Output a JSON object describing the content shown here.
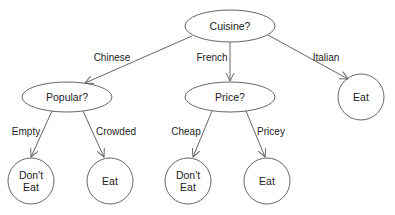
{
  "diagram": {
    "type": "decision-tree",
    "colors": {
      "stroke": "#666666",
      "text": "#222222",
      "background": "#ffffff"
    },
    "nodes": [
      {
        "id": "cuisine",
        "label": "Cuisine?",
        "shape": "ellipse"
      },
      {
        "id": "popular",
        "label": "Popular?",
        "shape": "ellipse"
      },
      {
        "id": "price",
        "label": "Price?",
        "shape": "ellipse"
      },
      {
        "id": "italian_eat",
        "label": "Eat",
        "shape": "circle"
      },
      {
        "id": "empty_dont",
        "label": "Don't\nEat",
        "shape": "circle"
      },
      {
        "id": "crowded_eat",
        "label": "Eat",
        "shape": "circle"
      },
      {
        "id": "cheap_dont",
        "label": "Don't\nEat",
        "shape": "circle"
      },
      {
        "id": "pricey_eat",
        "label": "Eat",
        "shape": "circle"
      }
    ],
    "edges": [
      {
        "from": "cuisine",
        "to": "popular",
        "label": "Chinese"
      },
      {
        "from": "cuisine",
        "to": "price",
        "label": "French"
      },
      {
        "from": "cuisine",
        "to": "italian_eat",
        "label": "Italian"
      },
      {
        "from": "popular",
        "to": "empty_dont",
        "label": "Empty"
      },
      {
        "from": "popular",
        "to": "crowded_eat",
        "label": "Crowded"
      },
      {
        "from": "price",
        "to": "cheap_dont",
        "label": "Cheap"
      },
      {
        "from": "price",
        "to": "pricey_eat",
        "label": "Pricey"
      }
    ]
  }
}
